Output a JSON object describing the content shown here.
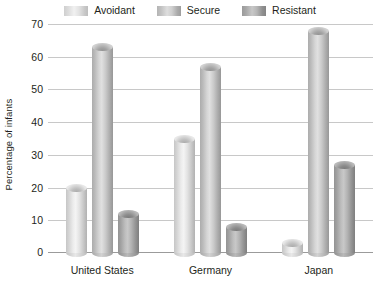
{
  "chart_data": {
    "type": "bar",
    "title": "",
    "subtitle": "",
    "xlabel": "",
    "ylabel": "Percentage of infants",
    "categories": [
      "United States",
      "Germany",
      "Japan"
    ],
    "series": [
      {
        "name": "Avoidant",
        "values": [
          20,
          35,
          3
        ]
      },
      {
        "name": "Secure",
        "values": [
          63,
          57,
          68
        ]
      },
      {
        "name": "Resistant",
        "values": [
          12,
          8,
          27
        ]
      }
    ],
    "ylim": [
      0,
      70
    ],
    "yticks": [
      0,
      10,
      20,
      30,
      40,
      50,
      60,
      70
    ],
    "ytick_labels": [
      "0",
      "10",
      "20",
      "30",
      "40",
      "50",
      "60",
      "70"
    ],
    "grid": true,
    "legend_position": "top",
    "bar_style": "3d-cylinder",
    "colors": {
      "avoidant": "#e3e3e3",
      "secure": "#c7c7c7",
      "resistant": "#a6a6a6",
      "gridline": "#c8c8c8",
      "axis": "#9b9b9b",
      "text": "#231f20",
      "background": "#ffffff"
    }
  },
  "legend": {
    "items": [
      {
        "label": "Avoidant",
        "swatch": "legend-swatch-avoidant"
      },
      {
        "label": "Secure",
        "swatch": "legend-swatch-secure"
      },
      {
        "label": "Resistant",
        "swatch": "legend-swatch-resistant"
      }
    ]
  }
}
